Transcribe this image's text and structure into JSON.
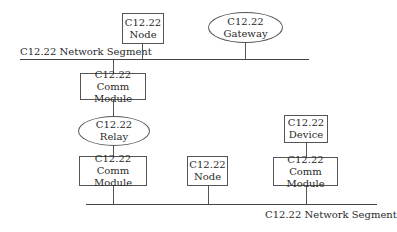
{
  "diagram": {
    "top_segment": {
      "label": "C12.22 Network Segment"
    },
    "bottom_segment": {
      "label": "C12.22 Network Segment"
    },
    "nodes": {
      "top_node": {
        "line1": "C12.22",
        "line2": "Node",
        "shape": "rectangle"
      },
      "gateway": {
        "line1": "C12.22",
        "line2": "Gateway",
        "shape": "ellipse"
      },
      "comm_module_upper": {
        "line1": "C12.22 Comm",
        "line2": "Module",
        "shape": "rectangle"
      },
      "relay": {
        "line1": "C12.22",
        "line2": "Relay",
        "shape": "ellipse"
      },
      "comm_module_left": {
        "line1": "C12.22 Comm",
        "line2": "Module",
        "shape": "rectangle"
      },
      "bottom_node": {
        "line1": "C12.22",
        "line2": "Node",
        "shape": "rectangle"
      },
      "device": {
        "line1": "C12.22",
        "line2": "Device",
        "shape": "rectangle"
      },
      "comm_module_right": {
        "line1": "C12.22 Comm",
        "line2": "Module",
        "shape": "rectangle"
      }
    },
    "connections": [
      [
        "top_node",
        "top_segment"
      ],
      [
        "gateway",
        "top_segment"
      ],
      [
        "top_segment",
        "comm_module_upper"
      ],
      [
        "comm_module_upper",
        "relay"
      ],
      [
        "relay",
        "comm_module_left"
      ],
      [
        "comm_module_left",
        "bottom_segment"
      ],
      [
        "bottom_node",
        "bottom_segment"
      ],
      [
        "device",
        "comm_module_right"
      ],
      [
        "comm_module_right",
        "bottom_segment"
      ]
    ]
  }
}
